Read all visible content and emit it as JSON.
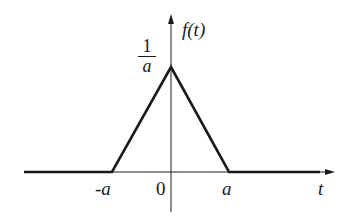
{
  "diagram": {
    "function_label": "f(t)",
    "x_axis_label": "t",
    "peak_label": {
      "numerator": "1",
      "denominator": "a"
    },
    "tick_labels": {
      "neg_a": "-a",
      "zero": "0",
      "pos_a": "a"
    },
    "shape": "triangular pulse",
    "colors": {
      "line": "#1a1a1a",
      "background": "#ffffff"
    }
  }
}
